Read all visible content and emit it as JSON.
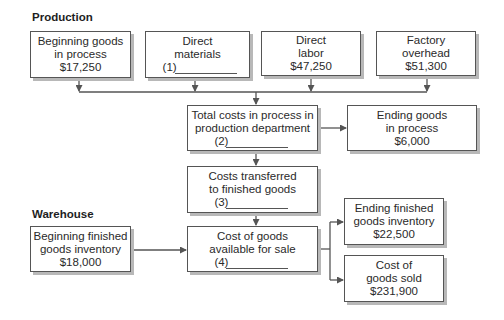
{
  "sections": {
    "production": "Production",
    "warehouse": "Warehouse"
  },
  "boxes": {
    "beginning_goods_in_process": {
      "lines": [
        "Beginning goods",
        "in process",
        "$17,250"
      ]
    },
    "direct_materials": {
      "lines": [
        "Direct",
        "materials"
      ],
      "blank": "(1)"
    },
    "direct_labor": {
      "lines": [
        "Direct",
        "labor",
        "$47,250"
      ]
    },
    "factory_overhead": {
      "lines": [
        "Factory",
        "overhead",
        "$51,300"
      ]
    },
    "total_costs_in_process": {
      "lines": [
        "Total costs in process in",
        "production department"
      ],
      "blank": "(2)"
    },
    "ending_goods_in_process": {
      "lines": [
        "Ending goods",
        "in process",
        "$6,000"
      ]
    },
    "costs_transferred": {
      "lines": [
        "Costs transferred",
        "to finished goods"
      ],
      "blank": "(3)"
    },
    "beginning_finished_goods": {
      "lines": [
        "Beginning finished",
        "goods inventory",
        "$18,000"
      ]
    },
    "cost_of_goods_available": {
      "lines": [
        "Cost of goods",
        "available for sale"
      ],
      "blank": "(4)"
    },
    "ending_finished_goods": {
      "lines": [
        "Ending finished",
        "goods inventory",
        "$22,500"
      ]
    },
    "cost_of_goods_sold": {
      "lines": [
        "Cost of",
        "goods sold",
        "$231,900"
      ]
    }
  },
  "colors": {
    "line": "#555555",
    "shadow": "#b8b8b8"
  }
}
